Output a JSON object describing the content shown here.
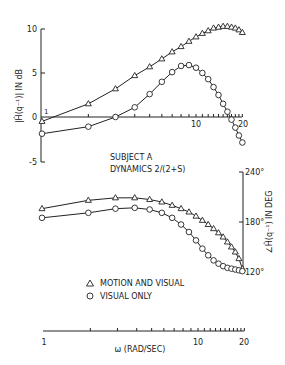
{
  "chart_data": [
    {
      "type": "line",
      "title": "Magnitude",
      "xlabel": "ω (RAD/SEC)",
      "ylabel": "|Ĥ(q⁻¹)| IN dB",
      "xscale": "log",
      "xlim": [
        1,
        20
      ],
      "ylim": [
        -5,
        10
      ],
      "yticks": [
        10,
        5,
        0,
        -5
      ],
      "xtick_labels": [
        "1",
        "10",
        "20"
      ],
      "grid": false,
      "series": [
        {
          "name": "MOTION AND VISUAL",
          "marker": "triangle",
          "x": [
            1,
            2,
            3,
            4,
            5,
            6,
            7,
            8,
            9,
            10,
            11,
            12,
            13,
            14,
            15,
            16,
            17,
            18,
            19,
            20
          ],
          "y": [
            -0.5,
            1.5,
            3.2,
            4.7,
            5.7,
            6.6,
            7.4,
            8.0,
            8.6,
            9.1,
            9.5,
            9.8,
            10.1,
            10.2,
            10.3,
            10.3,
            10.2,
            10.1,
            9.9,
            9.6
          ]
        },
        {
          "name": "VISUAL ONLY",
          "marker": "circle",
          "x": [
            1,
            2,
            3,
            4,
            5,
            6,
            7,
            8,
            9,
            10,
            11,
            12,
            13,
            14,
            15,
            16,
            17,
            18,
            19,
            20
          ],
          "y": [
            -1.9,
            -1.1,
            0.0,
            1.1,
            2.6,
            4.0,
            5.1,
            5.8,
            5.9,
            5.6,
            5.0,
            4.3,
            3.4,
            2.5,
            1.5,
            0.6,
            -0.3,
            -1.2,
            -2.1,
            -2.9
          ]
        }
      ]
    },
    {
      "type": "line",
      "title": "Phase",
      "xlabel": "ω (RAD/SEC)",
      "ylabel": "∠Ĥ(q⁻¹) IN DEG",
      "xscale": "log",
      "xlim": [
        1,
        20
      ],
      "ylim": [
        120,
        240
      ],
      "yticks": [
        "240°",
        "180°",
        "120°"
      ],
      "xtick_labels": [
        "1",
        "10",
        "20"
      ],
      "grid": false,
      "series": [
        {
          "name": "MOTION AND VISUAL",
          "marker": "triangle",
          "x": [
            1,
            2,
            3,
            4,
            5,
            6,
            7,
            8,
            9,
            10,
            11,
            12,
            13,
            14,
            15,
            16,
            17,
            18,
            19,
            20
          ],
          "y": [
            196,
            206,
            209,
            209,
            207,
            204,
            200,
            196,
            192,
            187,
            182,
            177,
            172,
            167,
            162,
            156,
            150,
            144,
            136,
            124
          ]
        },
        {
          "name": "VISUAL ONLY",
          "marker": "circle",
          "x": [
            1,
            2,
            3,
            4,
            5,
            6,
            7,
            8,
            9,
            10,
            11,
            12,
            13,
            14,
            15,
            16,
            17,
            18,
            19,
            20
          ],
          "y": [
            185,
            191,
            196,
            197,
            195,
            191,
            185,
            177,
            168,
            158,
            148,
            140,
            134,
            130,
            127,
            125,
            124,
            123,
            122,
            121
          ]
        }
      ]
    }
  ],
  "labels": {
    "subject": "SUBJECT A",
    "dynamics": "DYNAMICS 2/(2+S)",
    "mag_ylabel": "|Ĥ(q⁻¹)| IN dB",
    "phase_ylabel": "∠Ĥ(q⁻¹) IN DEG",
    "xlabel": "ω (RAD/SEC)",
    "legend_motion": "MOTION AND VISUAL",
    "legend_visual": "VISUAL ONLY",
    "legend_triangle": "Δ",
    "legend_circle": "O",
    "mag_ticks": [
      "10",
      "5",
      "0",
      "-5"
    ],
    "phase_ticks": [
      "240°",
      "180°",
      "120°"
    ],
    "top_x_1": "1",
    "top_x_10": "10",
    "top_x_20": "20",
    "bot_x_1": "1",
    "bot_x_10": "10",
    "bot_x_20": "20"
  }
}
